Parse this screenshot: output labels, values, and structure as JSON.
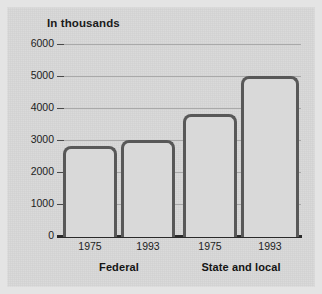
{
  "chart_data": {
    "type": "bar",
    "title": "In thousands",
    "subtitle": "",
    "xlabel": "",
    "ylabel": "",
    "ylim": [
      0,
      6000
    ],
    "ytick_labels": [
      "0",
      "1000",
      "2000",
      "3000",
      "4000",
      "5000",
      "6000"
    ],
    "ytick_values": [
      0,
      1000,
      2000,
      3000,
      4000,
      5000,
      6000
    ],
    "grid": true,
    "legend": null,
    "groups": [
      {
        "label": "Federal",
        "categories": [
          "1975",
          "1993"
        ],
        "values": [
          2800,
          3000
        ]
      },
      {
        "label": "State and local",
        "categories": [
          "1975",
          "1993"
        ],
        "values": [
          3800,
          5000
        ]
      }
    ],
    "categories": [
      "1975",
      "1993",
      "1975",
      "1993"
    ],
    "values": [
      2800,
      3000,
      3800,
      5000
    ],
    "bar_fill_color": "#d9d9d9",
    "bar_outline_color": "#585858",
    "gridline_color": "#a9a9a9",
    "axis_color": "#2a2a2a",
    "background_color": "#d6d6d6"
  },
  "axis": {
    "ticks": [
      {
        "label": "6000",
        "value": 6000
      },
      {
        "label": "5000",
        "value": 5000
      },
      {
        "label": "4000",
        "value": 4000
      },
      {
        "label": "3000",
        "value": 3000
      },
      {
        "label": "2000",
        "value": 2000
      },
      {
        "label": "1000",
        "value": 1000
      },
      {
        "label": "0",
        "value": 0
      }
    ]
  },
  "bars": [
    {
      "category": "1975",
      "group": "Federal",
      "value": 2800
    },
    {
      "category": "1993",
      "group": "Federal",
      "value": 3000
    },
    {
      "category": "1975",
      "group": "State and local",
      "value": 3800
    },
    {
      "category": "1993",
      "group": "State and local",
      "value": 5000
    }
  ],
  "group_labels": [
    {
      "label": "Federal"
    },
    {
      "label": "State and local"
    }
  ]
}
